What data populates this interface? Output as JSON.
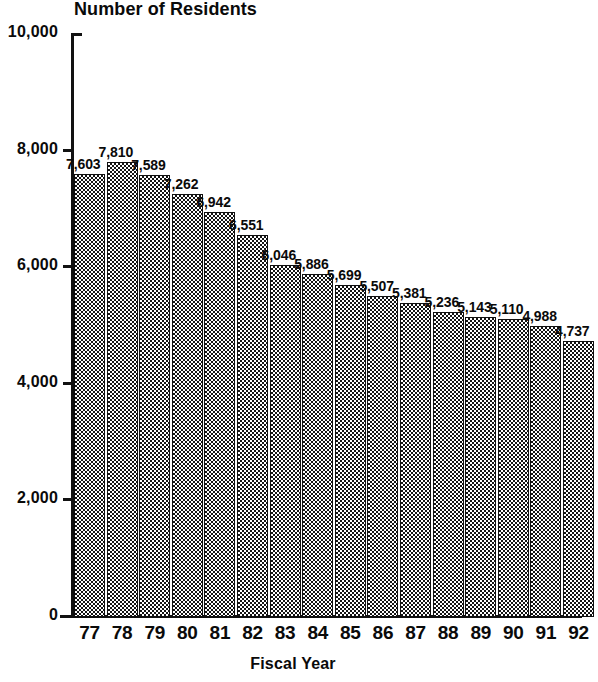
{
  "chart_data": {
    "type": "bar",
    "title": "Number of Residents",
    "xlabel": "Fiscal Year",
    "ylabel": "",
    "categories": [
      "77",
      "78",
      "79",
      "80",
      "81",
      "82",
      "83",
      "84",
      "85",
      "86",
      "87",
      "88",
      "89",
      "90",
      "91",
      "92"
    ],
    "values": [
      7603,
      7810,
      7589,
      7262,
      6942,
      6551,
      6046,
      5886,
      5699,
      5507,
      5381,
      5236,
      5143,
      5110,
      4988,
      4737
    ],
    "value_labels": [
      "7,603",
      "7,810",
      "7,589",
      "7,262",
      "6,942",
      "6,551",
      "6,046",
      "5,886",
      "5,699",
      "5,507",
      "5,381",
      "5,236",
      "5,143",
      "5,110",
      "4,988",
      "4,737"
    ],
    "ylim": [
      0,
      10000
    ],
    "ytick_values": [
      10000,
      8000,
      6000,
      4000,
      2000,
      0
    ],
    "ytick_labels": [
      "10,000",
      "8,000",
      "6,000",
      "4,000",
      "2,000",
      "0"
    ],
    "grid": false,
    "legend": null,
    "series_name": "Number of Residents",
    "bar_fill": "checkerboard-dither",
    "colors": {
      "ink": "#121212",
      "background": "#ffffff"
    }
  }
}
